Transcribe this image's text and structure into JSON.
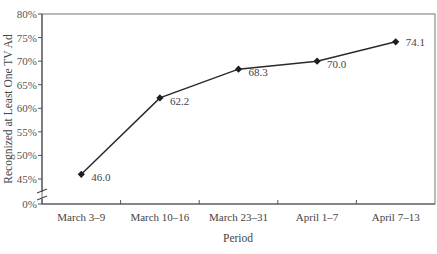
{
  "chart_data": {
    "type": "line",
    "title": "",
    "xlabel": "Period",
    "ylabel": "Recognized at Least One TV Ad",
    "categories": [
      "March 3–9",
      "March 10–16",
      "March 23–31",
      "April 1–7",
      "April 7–13"
    ],
    "series": [
      {
        "name": "Recognized at Least One TV Ad",
        "values": [
          46.0,
          62.2,
          68.3,
          70.0,
          74.1
        ],
        "marker": "diamond"
      }
    ],
    "data_labels": [
      "46.0",
      "62.2",
      "68.3",
      "70.0",
      "74.1"
    ],
    "y_ticks": [
      "0%",
      "45%",
      "50%",
      "55%",
      "60%",
      "65%",
      "70%",
      "75%",
      "80%"
    ],
    "y_axis_break": {
      "from": 0,
      "to": 45
    },
    "ylim": [
      45,
      80
    ],
    "grid": false,
    "legend": "none",
    "frame": true,
    "line_color": "#2a2a2a"
  }
}
